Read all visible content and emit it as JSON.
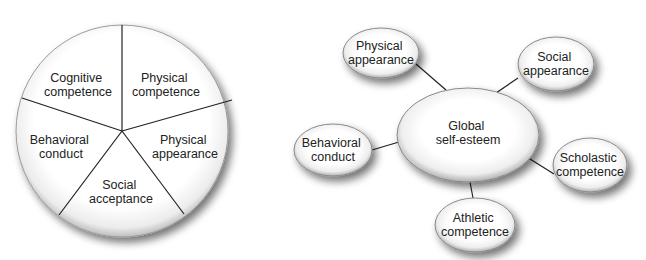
{
  "pie_diagram": {
    "segments": [
      {
        "line1": "Cognitive",
        "line2": "competence"
      },
      {
        "line1": "Physical",
        "line2": "competence"
      },
      {
        "line1": "Physical",
        "line2": "appearance"
      },
      {
        "line1": "Social",
        "line2": "acceptance"
      },
      {
        "line1": "Behavioral",
        "line2": "conduct"
      }
    ]
  },
  "hub_diagram": {
    "center": {
      "line1": "Global",
      "line2": "self-esteem"
    },
    "nodes": [
      {
        "line1": "Physical",
        "line2": "appearance"
      },
      {
        "line1": "Social",
        "line2": "appearance"
      },
      {
        "line1": "Behavioral",
        "line2": "conduct"
      },
      {
        "line1": "Scholastic",
        "line2": "competence"
      },
      {
        "line1": "Athletic",
        "line2": "competence"
      }
    ]
  },
  "colors": {
    "line": "#222222",
    "fill": "#ffffff",
    "shadow": "#555555"
  }
}
